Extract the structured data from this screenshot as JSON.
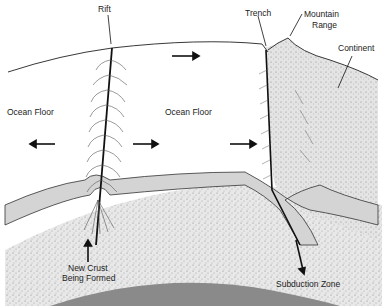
{
  "labels": {
    "rift": "Rift",
    "trench": "Trench",
    "mountain_range_1": "Mountain",
    "mountain_range_2": "Range",
    "continent": "Continent",
    "ocean_floor_left": "Ocean Floor",
    "ocean_floor_center": "Ocean Floor",
    "new_crust_1": "New Crust",
    "new_crust_2": "Being Formed",
    "subduction_zone": "Subduction Zone"
  },
  "colors": {
    "background": "#ffffff",
    "line": "#222222",
    "crust_band": "#d4d4d4",
    "mantle_stipple": "#e6e6e6",
    "continent_stipple": "#e2e2e2",
    "core": "#8a8a8a"
  },
  "arrows": [
    {
      "direction": "left",
      "meaning": "plate motion"
    },
    {
      "direction": "right",
      "meaning": "plate motion"
    },
    {
      "direction": "right",
      "meaning": "plate motion"
    },
    {
      "direction": "right",
      "meaning": "plate motion"
    },
    {
      "direction": "up",
      "meaning": "magma upwelling"
    },
    {
      "direction": "down",
      "meaning": "subduction"
    }
  ]
}
